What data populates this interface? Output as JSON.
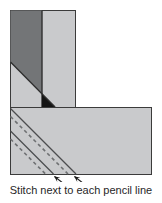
{
  "caption": "Stitch next to each pencil line",
  "colors": {
    "background": "#ffffff",
    "fabric_light": "#c9cacc",
    "fabric_dark": "#737577",
    "corner_black": "#141414",
    "outline": "#3b3b3b",
    "divider": "#2f2f2f",
    "seam_diagonal": "#2f2f2f",
    "pencil_line": "#4b4d4f",
    "stitch_line": "#6e7072",
    "arrow": "#1a1a1a",
    "caption_text": "#272727"
  }
}
